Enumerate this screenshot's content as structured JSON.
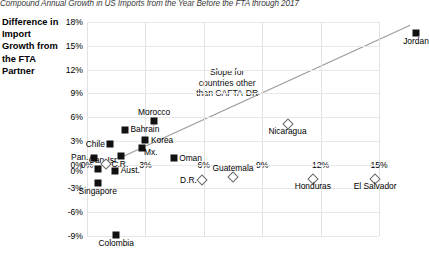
{
  "chart_data": {
    "type": "scatter",
    "title": "Compound Annual Growth in US Imports from the Year Before the FTA through 2017",
    "ylabel": "Difference in Import Growth from the FTA Partner",
    "xlabel": "",
    "xlim": [
      0,
      15
    ],
    "ylim": [
      -9,
      18
    ],
    "xticks": [
      "0%",
      "3%",
      "6%",
      "9%",
      "12%",
      "15%"
    ],
    "xtick_values": [
      0,
      3,
      6,
      9,
      12,
      15
    ],
    "yticks": [
      "18%",
      "15%",
      "12%",
      "9%",
      "6%",
      "3%",
      "0%",
      "-3%",
      "-6%",
      "-9%"
    ],
    "ytick_values": [
      18,
      15,
      12,
      9,
      6,
      3,
      0,
      -3,
      -6,
      -9
    ],
    "grid": true,
    "legend_position": "none",
    "series": [
      {
        "name": "Countries other than CAFTA-DR",
        "marker": "filled-square",
        "points": [
          {
            "label": "Jordan",
            "x": 16.9,
            "y": 16.6,
            "label_pos": "below"
          },
          {
            "label": "Morocco",
            "x": 3.45,
            "y": 5.5,
            "label_pos": "above"
          },
          {
            "label": "Bahrain",
            "x": 1.95,
            "y": 4.4,
            "label_pos": "right"
          },
          {
            "label": "Korea",
            "x": 3.0,
            "y": 3.1,
            "label_pos": "right"
          },
          {
            "label": "Chile",
            "x": 1.2,
            "y": 2.6,
            "label_pos": "left"
          },
          {
            "label": "Mx.",
            "x": 2.8,
            "y": 2.1,
            "label_pos": "br"
          },
          {
            "label": "Isr.",
            "x": 1.75,
            "y": 1.15,
            "label_pos": "bl"
          },
          {
            "label": "Pan.",
            "x": 0.35,
            "y": 0.85,
            "label_pos": "left"
          },
          {
            "label": "Oman",
            "x": 4.45,
            "y": 0.8,
            "label_pos": "right"
          },
          {
            "label": "Can.",
            "x": 0.55,
            "y": -0.55,
            "label_pos": "above"
          },
          {
            "label": "Aust.",
            "x": 1.45,
            "y": -0.75,
            "label_pos": "right"
          },
          {
            "label": "Singapore",
            "x": 0.55,
            "y": -2.35,
            "label_pos": "below"
          },
          {
            "label": "Colombia",
            "x": 1.5,
            "y": -8.9,
            "label_pos": "below"
          }
        ]
      },
      {
        "name": "CAFTA-DR countries",
        "marker": "open-diamond",
        "points": [
          {
            "label": "Nicaragua",
            "x": 10.3,
            "y": 5.1,
            "label_pos": "below"
          },
          {
            "label": "C.R.",
            "x": 1.0,
            "y": 0.05,
            "label_pos": "right"
          },
          {
            "label": "Guatemala",
            "x": 7.5,
            "y": -1.6,
            "label_pos": "above"
          },
          {
            "label": "D.R.",
            "x": 5.9,
            "y": -1.9,
            "label_pos": "left"
          },
          {
            "label": "Honduras",
            "x": 11.6,
            "y": -1.85,
            "label_pos": "below"
          },
          {
            "label": "El Salvador",
            "x": 14.8,
            "y": -1.85,
            "label_pos": "below"
          }
        ]
      }
    ],
    "trendline": {
      "label_line1": "Slope for",
      "label_line2": "countries other",
      "label_line3": "than CAFTA-DR",
      "x1": 1.9,
      "y1": 1.1,
      "x2": 16.6,
      "y2": 17.6,
      "color": "#9a9a9a"
    },
    "origin_label": "0%"
  }
}
